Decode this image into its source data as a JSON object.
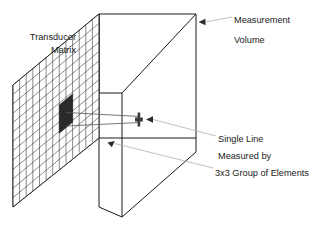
{
  "figure": {
    "background_color": "#ffffff",
    "width": 321,
    "height": 231
  },
  "labels": {
    "transducer_matrix_line1": "Transducer",
    "transducer_matrix_line2": "Matrix",
    "measurement": "Measurement",
    "volume": "Volume",
    "single_line": "Single Line",
    "measured_by": "Measured by",
    "group_of_elements": "3x3 Group of Elements"
  },
  "colors": {
    "outline": "#1a1a1a",
    "grid": "#2b2b2b",
    "active_group": "#2a2a2a",
    "leader": "#b9b9b9",
    "beam": "#555555",
    "text": "#1a1a1a"
  },
  "geometry": {
    "grid_columns": 13,
    "grid_rows": 13,
    "active_group_size": "3x3",
    "matrix_left_x": 13,
    "matrix_right_x": 99,
    "box_right_x": 196,
    "box_top_y": 14,
    "box_bottom_y": 217
  }
}
